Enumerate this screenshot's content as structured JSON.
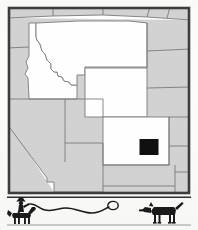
{
  "figure": {
    "kind": "locator-map",
    "region": "Western United States",
    "frame_border_color": "#3a3a3a",
    "background_color": "#fcfcfb"
  },
  "map": {
    "highlighted_fill": "#ffffff",
    "other_states_fill": "#d2d2d2",
    "border_line_color": "#7a7a7a",
    "outer_frame_color": "#3d3d3d",
    "highlighted_states": [
      {
        "name": "Idaho",
        "abbr": "ID"
      },
      {
        "name": "Montana",
        "abbr": "MT"
      },
      {
        "name": "Wyoming",
        "abbr": "WY"
      },
      {
        "name": "Colorado",
        "abbr": "CO"
      }
    ],
    "other_states": [
      {
        "name": "Washington",
        "abbr": "WA"
      },
      {
        "name": "Oregon",
        "abbr": "OR"
      },
      {
        "name": "Nevada",
        "abbr": "NV"
      },
      {
        "name": "Utah",
        "abbr": "UT"
      },
      {
        "name": "Arizona",
        "abbr": "AZ"
      },
      {
        "name": "New Mexico",
        "abbr": "NM"
      },
      {
        "name": "North Dakota",
        "abbr": "ND"
      },
      {
        "name": "South Dakota",
        "abbr": "SD"
      },
      {
        "name": "Nebraska",
        "abbr": "NE"
      },
      {
        "name": "Kansas",
        "abbr": "KS"
      }
    ],
    "marker": {
      "name": "county-highlight",
      "fill": "#101010",
      "stroke": "#ffffff",
      "located_in": "Colorado",
      "x": 133,
      "y": 133,
      "width": 19,
      "height": 16
    }
  },
  "footer": {
    "divider_color": "#2f2f2f",
    "figures": [
      {
        "name": "cowboy-on-horse-with-lasso",
        "fill": "#1a1a1a"
      },
      {
        "name": "lasso-rope",
        "fill": "#1a1a1a"
      },
      {
        "name": "dog",
        "fill": "#1a1a1a"
      }
    ]
  }
}
